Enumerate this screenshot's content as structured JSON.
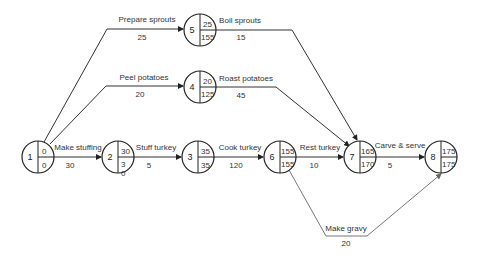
{
  "diagram": {
    "type": "activity-on-arrow network",
    "nodes": [
      {
        "id": "1",
        "earliest": "0",
        "latest": "0"
      },
      {
        "id": "2",
        "earliest": "30",
        "latest": "3",
        "extra": "0"
      },
      {
        "id": "3",
        "earliest": "35",
        "latest": "35"
      },
      {
        "id": "4",
        "earliest": "20",
        "latest": "125"
      },
      {
        "id": "5",
        "earliest": "25",
        "latest": "155"
      },
      {
        "id": "6",
        "earliest": "155",
        "latest": "155"
      },
      {
        "id": "7",
        "earliest": "165",
        "latest": "170"
      },
      {
        "id": "8",
        "earliest": "175",
        "latest": "175"
      }
    ],
    "activities": [
      {
        "name": "Prepare sprouts",
        "duration": "25",
        "from": "1",
        "to": "5"
      },
      {
        "name": "Peel potatoes",
        "duration": "20",
        "from": "1",
        "to": "4"
      },
      {
        "name": "Make stuffing",
        "duration": "30",
        "from": "1",
        "to": "2"
      },
      {
        "name": "Stuff turkey",
        "duration": "5",
        "from": "2",
        "to": "3"
      },
      {
        "name": "Cook turkey",
        "duration": "120",
        "from": "3",
        "to": "6"
      },
      {
        "name": "Boil sprouts",
        "duration": "15",
        "from": "5",
        "to": "7"
      },
      {
        "name": "Roast potatoes",
        "duration": "45",
        "from": "4",
        "to": "7"
      },
      {
        "name": "Rest turkey",
        "duration": "10",
        "from": "6",
        "to": "7"
      },
      {
        "name": "Carve & serve",
        "duration": "5",
        "from": "7",
        "to": "8"
      },
      {
        "name": "Make gravy",
        "duration": "20",
        "from": "6",
        "to": "8"
      }
    ]
  }
}
